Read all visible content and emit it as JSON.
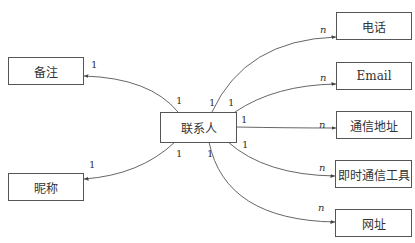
{
  "diagram": {
    "type": "entity-relationship",
    "center": {
      "id": "contact",
      "label": "联系人"
    },
    "entities": [
      {
        "id": "notes",
        "label": "备注"
      },
      {
        "id": "nickname",
        "label": "昵称"
      },
      {
        "id": "phone",
        "label": "电话"
      },
      {
        "id": "email",
        "label": "Email"
      },
      {
        "id": "address",
        "label": "通信地址"
      },
      {
        "id": "im",
        "label": "即时通信工具"
      },
      {
        "id": "website",
        "label": "网址"
      }
    ],
    "relations": [
      {
        "from": "contact",
        "to": "notes",
        "from_card": "1",
        "to_card": "1"
      },
      {
        "from": "contact",
        "to": "nickname",
        "from_card": "1",
        "to_card": "1"
      },
      {
        "from": "contact",
        "to": "phone",
        "from_card": "1",
        "to_card": "n"
      },
      {
        "from": "contact",
        "to": "email",
        "from_card": "1",
        "to_card": "n"
      },
      {
        "from": "contact",
        "to": "address",
        "from_card": "1",
        "to_card": "n"
      },
      {
        "from": "contact",
        "to": "im",
        "from_card": "1",
        "to_card": "n"
      },
      {
        "from": "contact",
        "to": "website",
        "from_card": "1",
        "to_card": "n"
      }
    ],
    "colors": {
      "line": "#555555",
      "text": "#333333",
      "background": "#ffffff"
    }
  }
}
